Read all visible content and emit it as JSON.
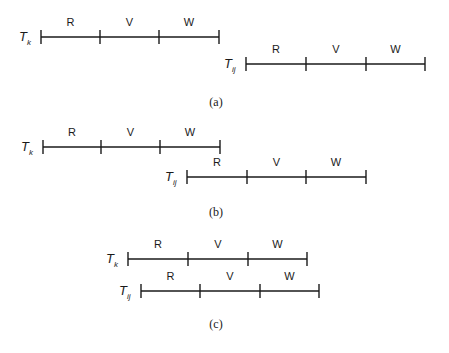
{
  "diagram": {
    "segment_labels": [
      "R",
      "V",
      "W"
    ],
    "panels": [
      {
        "caption": "(a)",
        "caption_pos": [
          216,
          106
        ],
        "timelines": [
          {
            "name": "T",
            "sub": "k",
            "x0": 41,
            "x1": 219,
            "y": 37,
            "ticks": [
              100,
              159
            ],
            "label_x": 19
          },
          {
            "name": "T",
            "sub": "ij",
            "x0": 246,
            "x1": 425,
            "y": 64,
            "ticks": [
              306,
              366
            ],
            "label_x": 224
          }
        ]
      },
      {
        "caption": "(b)",
        "caption_pos": [
          216,
          216
        ],
        "timelines": [
          {
            "name": "T",
            "sub": "k",
            "x0": 43,
            "x1": 220,
            "y": 147,
            "ticks": [
              101,
              160
            ],
            "label_x": 21
          },
          {
            "name": "T",
            "sub": "ij",
            "x0": 187,
            "x1": 366,
            "y": 177,
            "ticks": [
              247,
              306
            ],
            "label_x": 165
          }
        ]
      },
      {
        "caption": "(c)",
        "caption_pos": [
          216,
          328
        ],
        "timelines": [
          {
            "name": "T",
            "sub": "k",
            "x0": 128,
            "x1": 307,
            "y": 259,
            "ticks": [
              188,
              248
            ],
            "label_x": 106
          },
          {
            "name": "T",
            "sub": "ij",
            "x0": 141,
            "x1": 319,
            "y": 291,
            "ticks": [
              200,
              260
            ],
            "label_x": 119
          }
        ]
      }
    ]
  }
}
